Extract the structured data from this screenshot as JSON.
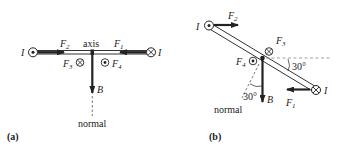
{
  "panel_a": {
    "tag": "(a)",
    "current_left": "I",
    "current_right": "I",
    "F2": "F",
    "F2_sub": "2",
    "F1": "F",
    "F1_sub": "1",
    "F3": "F",
    "F3_sub": "3",
    "F4": "F",
    "F4_sub": "4",
    "axis_label": "axis",
    "field_label": "B",
    "normal_label": "normal"
  },
  "panel_b": {
    "tag": "(b)",
    "current_left": "I",
    "current_right": "I",
    "F2": "F",
    "F2_sub": "2",
    "F1": "F",
    "F1_sub": "1",
    "F3": "F",
    "F3_sub": "3",
    "F4": "F",
    "F4_sub": "4",
    "angle_label_top": "30°",
    "angle_label_bottom": "30°",
    "field_label": "B",
    "normal_label": "normal"
  },
  "colors": {
    "ink": "#222222",
    "dash": "#888888"
  }
}
